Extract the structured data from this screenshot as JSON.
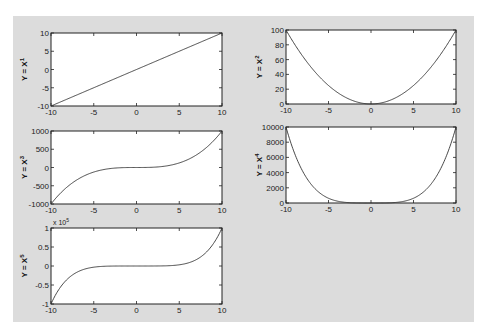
{
  "chart_data": [
    {
      "type": "line",
      "title": "",
      "xlabel": "",
      "ylabel": "Y = X",
      "ylabel_exp": "1",
      "function_power": 1,
      "x_range": [
        -10,
        10
      ],
      "xlim": [
        -10,
        10
      ],
      "ylim": [
        -10,
        10
      ],
      "xticks": [
        -10,
        -5,
        0,
        5,
        10
      ],
      "yticks": [
        -10,
        -5,
        0,
        5,
        10
      ],
      "ytick_labels": [
        "-10",
        "-5",
        "0",
        "5",
        "10"
      ],
      "multiplier": "",
      "multiplier_exp": "",
      "scale": 1,
      "series": [
        {
          "name": "y=x^1",
          "x": [
            -10,
            -5,
            0,
            5,
            10
          ],
          "y": [
            -10,
            -5,
            0,
            5,
            10
          ]
        }
      ]
    },
    {
      "type": "line",
      "title": "",
      "xlabel": "",
      "ylabel": "Y = X",
      "ylabel_exp": "2",
      "function_power": 2,
      "x_range": [
        -10,
        10
      ],
      "xlim": [
        -10,
        10
      ],
      "ylim": [
        0,
        100
      ],
      "xticks": [
        -10,
        -5,
        0,
        5,
        10
      ],
      "yticks": [
        0,
        20,
        40,
        60,
        80,
        100
      ],
      "ytick_labels": [
        "0",
        "20",
        "40",
        "60",
        "80",
        "100"
      ],
      "multiplier": "",
      "multiplier_exp": "",
      "scale": 1,
      "series": [
        {
          "name": "y=x^2",
          "x": [
            -10,
            -5,
            0,
            5,
            10
          ],
          "y": [
            100,
            25,
            0,
            25,
            100
          ]
        }
      ]
    },
    {
      "type": "line",
      "title": "",
      "xlabel": "",
      "ylabel": "Y = X",
      "ylabel_exp": "3",
      "function_power": 3,
      "x_range": [
        -10,
        10
      ],
      "xlim": [
        -10,
        10
      ],
      "ylim": [
        -1000,
        1000
      ],
      "xticks": [
        -10,
        -5,
        0,
        5,
        10
      ],
      "yticks": [
        -1000,
        -500,
        0,
        500,
        1000
      ],
      "ytick_labels": [
        "-1000",
        "-500",
        "0",
        "500",
        "1000"
      ],
      "multiplier": "",
      "multiplier_exp": "",
      "scale": 1,
      "series": [
        {
          "name": "y=x^3",
          "x": [
            -10,
            -5,
            0,
            5,
            10
          ],
          "y": [
            -1000,
            -125,
            0,
            125,
            1000
          ]
        }
      ]
    },
    {
      "type": "line",
      "title": "",
      "xlabel": "",
      "ylabel": "Y = X",
      "ylabel_exp": "4",
      "function_power": 4,
      "x_range": [
        -10,
        10
      ],
      "xlim": [
        -10,
        10
      ],
      "ylim": [
        0,
        10000
      ],
      "xticks": [
        -10,
        -5,
        0,
        5,
        10
      ],
      "yticks": [
        0,
        2000,
        4000,
        6000,
        8000,
        10000
      ],
      "ytick_labels": [
        "0",
        "2000",
        "4000",
        "6000",
        "8000",
        "10000"
      ],
      "multiplier": "",
      "multiplier_exp": "",
      "scale": 1,
      "series": [
        {
          "name": "y=x^4",
          "x": [
            -10,
            -5,
            0,
            5,
            10
          ],
          "y": [
            10000,
            625,
            0,
            625,
            10000
          ]
        }
      ]
    },
    {
      "type": "line",
      "title": "",
      "xlabel": "",
      "ylabel": "Y = X",
      "ylabel_exp": "5",
      "function_power": 5,
      "x_range": [
        -10,
        10
      ],
      "xlim": [
        -10,
        10
      ],
      "ylim": [
        -100000,
        100000
      ],
      "xticks": [
        -10,
        -5,
        0,
        5,
        10
      ],
      "yticks": [
        -100000,
        -50000,
        0,
        50000,
        100000
      ],
      "ytick_labels": [
        "-1",
        "-0.5",
        "0",
        "0.5",
        "1"
      ],
      "multiplier": "x 10",
      "multiplier_exp": "5",
      "scale": 100000,
      "series": [
        {
          "name": "y=x^5",
          "x": [
            -10,
            -5,
            0,
            5,
            10
          ],
          "y": [
            -100000,
            -3125,
            0,
            3125,
            100000
          ]
        }
      ]
    }
  ]
}
